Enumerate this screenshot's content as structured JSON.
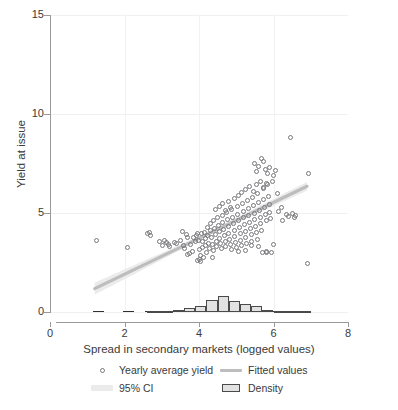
{
  "chart_data": {
    "type": "scatter",
    "title": "",
    "xlabel": "Spread in secondary markets (logged values)",
    "ylabel": "Yield at issue",
    "xlim": [
      0,
      8
    ],
    "ylim": [
      0,
      15
    ],
    "xticks": [
      0,
      2,
      4,
      6,
      8
    ],
    "yticks": [
      0,
      5,
      10,
      15
    ],
    "xtick_labels": [
      "0",
      "2",
      "4",
      "6",
      "8"
    ],
    "ytick_labels": [
      "0",
      "5",
      "10",
      "15"
    ],
    "grid": "horizontal and vertical, very light",
    "legend_position": "below axis, two columns",
    "legend": [
      {
        "key": "circle-marker",
        "label": "Yearly average yield"
      },
      {
        "key": "line",
        "label": "Fitted values"
      },
      {
        "key": "band",
        "label": "95% CI"
      },
      {
        "key": "box",
        "label": "Density"
      }
    ],
    "colors": {
      "marker_stroke": "#77777b",
      "fit_line": "#bdbdbd",
      "ci_band": "#ebebeb",
      "density_fill": "#e2e2e2",
      "density_stroke": "#4a4a4a",
      "axis": "#9a9a9a",
      "grid": "#f0f0f0",
      "text": "#3a3a3a"
    },
    "series": [
      {
        "name": "Yearly average yield",
        "type": "scatter",
        "points": [
          [
            1.25,
            3.6
          ],
          [
            2.08,
            3.25
          ],
          [
            2.62,
            3.95
          ],
          [
            2.66,
            4.0
          ],
          [
            2.7,
            3.88
          ],
          [
            2.95,
            3.55
          ],
          [
            3.02,
            3.35
          ],
          [
            3.08,
            3.6
          ],
          [
            3.12,
            3.5
          ],
          [
            3.18,
            3.42
          ],
          [
            3.22,
            3.3
          ],
          [
            3.35,
            3.5
          ],
          [
            3.4,
            3.45
          ],
          [
            3.5,
            3.62
          ],
          [
            3.55,
            4.05
          ],
          [
            3.58,
            3.35
          ],
          [
            3.62,
            3.2
          ],
          [
            3.66,
            3.9
          ],
          [
            3.7,
            3.78
          ],
          [
            3.74,
            2.95
          ],
          [
            3.78,
            3.4
          ],
          [
            3.82,
            3.05
          ],
          [
            3.86,
            3.75
          ],
          [
            3.9,
            3.55
          ],
          [
            3.94,
            3.85
          ],
          [
            3.96,
            3.95
          ],
          [
            3.98,
            3.6
          ],
          [
            4.0,
            2.65
          ],
          [
            4.02,
            3.15
          ],
          [
            4.04,
            2.85
          ],
          [
            4.06,
            3.95
          ],
          [
            4.08,
            3.55
          ],
          [
            4.1,
            3.25
          ],
          [
            4.12,
            2.75
          ],
          [
            4.14,
            4.0
          ],
          [
            4.16,
            3.7
          ],
          [
            4.18,
            3.35
          ],
          [
            4.2,
            3.0
          ],
          [
            4.22,
            4.25
          ],
          [
            4.24,
            3.85
          ],
          [
            4.26,
            3.45
          ],
          [
            4.28,
            3.2
          ],
          [
            4.3,
            4.45
          ],
          [
            4.32,
            4.1
          ],
          [
            4.34,
            3.75
          ],
          [
            4.36,
            3.4
          ],
          [
            4.38,
            3.1
          ],
          [
            4.4,
            4.6
          ],
          [
            4.42,
            4.2
          ],
          [
            4.44,
            3.9
          ],
          [
            4.46,
            3.55
          ],
          [
            4.48,
            3.3
          ],
          [
            4.5,
            4.75
          ],
          [
            4.52,
            4.35
          ],
          [
            4.54,
            4.05
          ],
          [
            4.56,
            3.7
          ],
          [
            4.58,
            3.45
          ],
          [
            4.6,
            3.2
          ],
          [
            4.62,
            4.9
          ],
          [
            4.64,
            4.5
          ],
          [
            4.66,
            4.15
          ],
          [
            4.68,
            3.85
          ],
          [
            4.7,
            3.55
          ],
          [
            4.72,
            3.3
          ],
          [
            4.74,
            5.05
          ],
          [
            4.76,
            4.65
          ],
          [
            4.78,
            4.3
          ],
          [
            4.8,
            3.95
          ],
          [
            4.82,
            3.65
          ],
          [
            4.84,
            3.4
          ],
          [
            4.86,
            3.15
          ],
          [
            4.88,
            5.2
          ],
          [
            4.9,
            4.8
          ],
          [
            4.92,
            4.45
          ],
          [
            4.94,
            4.1
          ],
          [
            4.96,
            3.8
          ],
          [
            4.98,
            3.5
          ],
          [
            5.0,
            3.25
          ],
          [
            5.02,
            5.35
          ],
          [
            5.04,
            4.95
          ],
          [
            5.06,
            4.6
          ],
          [
            5.08,
            4.25
          ],
          [
            5.1,
            3.95
          ],
          [
            5.12,
            3.6
          ],
          [
            5.14,
            3.35
          ],
          [
            5.16,
            5.5
          ],
          [
            5.18,
            5.1
          ],
          [
            5.2,
            4.75
          ],
          [
            5.22,
            4.4
          ],
          [
            5.24,
            4.05
          ],
          [
            5.26,
            3.75
          ],
          [
            5.28,
            3.45
          ],
          [
            5.3,
            5.65
          ],
          [
            5.32,
            5.25
          ],
          [
            5.34,
            4.9
          ],
          [
            5.36,
            4.5
          ],
          [
            5.38,
            4.2
          ],
          [
            5.4,
            3.9
          ],
          [
            5.42,
            3.55
          ],
          [
            5.44,
            5.8
          ],
          [
            5.46,
            5.4
          ],
          [
            5.48,
            5.0
          ],
          [
            5.5,
            4.65
          ],
          [
            5.52,
            4.3
          ],
          [
            5.54,
            4.0
          ],
          [
            5.56,
            3.65
          ],
          [
            5.58,
            6.0
          ],
          [
            5.6,
            5.55
          ],
          [
            5.62,
            5.15
          ],
          [
            5.64,
            4.8
          ],
          [
            5.66,
            4.45
          ],
          [
            5.68,
            4.1
          ],
          [
            5.7,
            3.0
          ],
          [
            5.72,
            6.25
          ],
          [
            5.74,
            5.7
          ],
          [
            5.76,
            5.3
          ],
          [
            5.78,
            4.95
          ],
          [
            5.8,
            4.6
          ],
          [
            5.82,
            3.05
          ],
          [
            5.84,
            6.45
          ],
          [
            5.86,
            5.85
          ],
          [
            5.88,
            5.45
          ],
          [
            5.9,
            5.05
          ],
          [
            5.92,
            4.7
          ],
          [
            5.94,
            3.0
          ],
          [
            5.96,
            6.6
          ],
          [
            4.45,
            5.2
          ],
          [
            4.55,
            5.35
          ],
          [
            4.62,
            5.5
          ],
          [
            4.7,
            5.15
          ],
          [
            4.78,
            5.6
          ],
          [
            4.85,
            5.3
          ],
          [
            4.95,
            5.75
          ],
          [
            5.05,
            5.9
          ],
          [
            5.15,
            6.05
          ],
          [
            5.25,
            6.2
          ],
          [
            5.35,
            6.35
          ],
          [
            5.45,
            6.1
          ],
          [
            5.55,
            6.45
          ],
          [
            5.65,
            6.6
          ],
          [
            5.72,
            6.3
          ],
          [
            5.8,
            6.5
          ],
          [
            5.5,
            7.5
          ],
          [
            5.55,
            7.1
          ],
          [
            5.6,
            7.35
          ],
          [
            5.68,
            7.75
          ],
          [
            5.72,
            7.6
          ],
          [
            5.78,
            7.2
          ],
          [
            5.85,
            7.0
          ],
          [
            5.9,
            7.3
          ],
          [
            6.0,
            6.9
          ],
          [
            6.05,
            7.15
          ],
          [
            6.1,
            6.0
          ],
          [
            6.12,
            5.1
          ],
          [
            6.2,
            5.3
          ],
          [
            6.25,
            4.6
          ],
          [
            6.35,
            4.95
          ],
          [
            6.4,
            4.85
          ],
          [
            6.45,
            8.8
          ],
          [
            6.5,
            5.0
          ],
          [
            6.55,
            4.75
          ],
          [
            6.6,
            4.9
          ],
          [
            6.95,
            7.0
          ],
          [
            6.9,
            2.45
          ],
          [
            5.05,
            3.05
          ],
          [
            5.25,
            3.1
          ],
          [
            5.4,
            3.35
          ],
          [
            5.6,
            3.3
          ],
          [
            6.0,
            3.4
          ],
          [
            5.82,
            3.0
          ],
          [
            4.35,
            2.75
          ],
          [
            4.05,
            2.55
          ],
          [
            3.95,
            2.6
          ],
          [
            3.68,
            2.9
          ]
        ]
      },
      {
        "name": "Fitted values",
        "type": "line",
        "x_range": [
          1.2,
          6.9
        ],
        "y_at_xmin": 1.18,
        "y_at_xmax": 6.35
      },
      {
        "name": "95% CI",
        "type": "band",
        "x_range": [
          1.2,
          6.9
        ],
        "half_width_at_xmin": 0.3,
        "half_width_at_center": 0.1,
        "half_width_at_xmax": 0.22
      },
      {
        "name": "Density",
        "type": "histogram",
        "bin_edges": [
          2.6,
          3.0,
          3.3,
          3.6,
          3.9,
          4.2,
          4.5,
          4.8,
          5.1,
          5.4,
          5.7,
          6.0,
          6.3,
          7.0
        ],
        "bin_heights": [
          0.04,
          0.04,
          0.08,
          0.22,
          0.3,
          0.62,
          0.8,
          0.56,
          0.42,
          0.3,
          0.12,
          0.06,
          0.03
        ],
        "baseline_segments": [
          [
            1.15,
            1.45
          ],
          [
            1.95,
            2.25
          ],
          [
            2.55,
            7.0
          ]
        ],
        "note": "counts drawn on the yield axis near zero"
      }
    ]
  }
}
